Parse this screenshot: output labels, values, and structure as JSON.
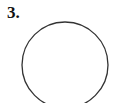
{
  "problem": {
    "number_label": "3."
  },
  "figure": {
    "shape": "circle",
    "stroke_color": "#333333"
  }
}
